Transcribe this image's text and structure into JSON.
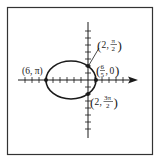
{
  "diagram": {
    "type": "polar-conic-graph",
    "equation_hint": "r = 6 / (3 + 2 cos θ)",
    "curve": "ellipse",
    "colors": {
      "stroke": "#1a1a1a",
      "frame": "#333333",
      "background": "#ffffff"
    },
    "labels": {
      "left_vertex": "(6, π)",
      "top_point_r": "2",
      "top_point_num": "π",
      "top_point_den": "2",
      "right_vertex_num": "6",
      "right_vertex_den": "5",
      "right_vertex_theta": "0",
      "bottom_point_r": "2",
      "bottom_point_num": "3π",
      "bottom_point_den": "2"
    },
    "points": [
      {
        "name": "left_vertex",
        "r": 6,
        "theta": "π"
      },
      {
        "name": "top_point",
        "r": 2,
        "theta": "π/2"
      },
      {
        "name": "right_vertex",
        "r": "6/5",
        "theta": 0
      },
      {
        "name": "bottom_point",
        "r": 2,
        "theta": "3π/2"
      }
    ]
  }
}
